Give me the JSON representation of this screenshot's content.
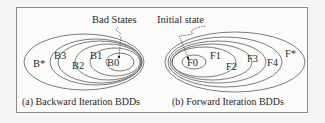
{
  "figure": {
    "panels": [
      {
        "id": "a",
        "caption": "(a) Backward Iteration BDDs",
        "annotation": "Bad States",
        "sets": [
          "B0",
          "B1",
          "B2",
          "B3",
          "B*"
        ]
      },
      {
        "id": "b",
        "caption": "(b) Forward Iteration BDDs",
        "annotation": "Initial state",
        "sets": [
          "F0",
          "F1",
          "F2",
          "F3",
          "F4",
          "F*"
        ]
      }
    ]
  },
  "colors": {
    "line": "#5a5a5a",
    "text": "#2a2a2a",
    "frame": "#8a8a8a",
    "background": "#fbfbfa"
  }
}
